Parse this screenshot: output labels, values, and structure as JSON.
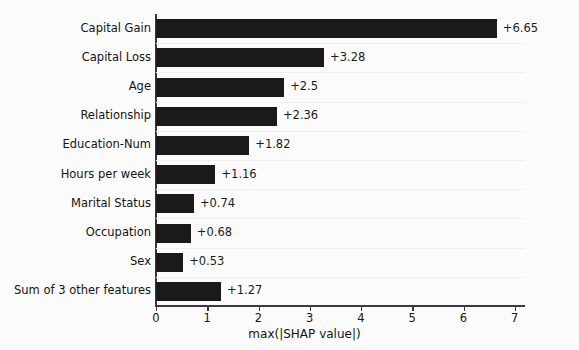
{
  "chart_data": {
    "type": "bar",
    "orientation": "horizontal",
    "title": "",
    "xlabel": "max(|SHAP value|)",
    "ylabel": "",
    "xlim": [
      0,
      7.2
    ],
    "xticks": [
      0,
      1,
      2,
      3,
      4,
      5,
      6,
      7
    ],
    "xtick_labels": [
      "0",
      "1",
      "2",
      "3",
      "4",
      "5",
      "6",
      "7"
    ],
    "grid": true,
    "grid_axis": "y",
    "legend": false,
    "bar_color": "#1a1a1a",
    "background_color": "#fbfbfb",
    "categories": [
      "Capital Gain",
      "Capital Loss",
      "Age",
      "Relationship",
      "Education-Num",
      "Hours per week",
      "Marital Status",
      "Occupation",
      "Sex",
      "Sum of 3 other features"
    ],
    "values": [
      6.65,
      3.28,
      2.5,
      2.36,
      1.82,
      1.16,
      0.74,
      0.68,
      0.53,
      1.27
    ],
    "value_labels": [
      "+6.65",
      "+3.28",
      "+2.5",
      "+2.36",
      "+1.82",
      "+1.16",
      "+0.74",
      "+0.68",
      "+0.53",
      "+1.27"
    ]
  }
}
